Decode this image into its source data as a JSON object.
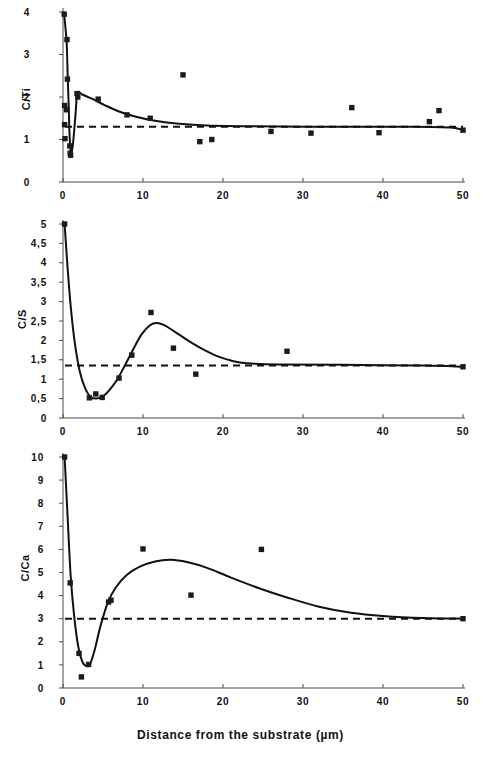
{
  "figure": {
    "xlabel": "Distance from the substrate (µm)",
    "background": "#ffffff",
    "marker_color": "#1b1b1b",
    "curve_color": "#111111",
    "axis_color": "#4a4a4a"
  },
  "chart_data": [
    {
      "type": "scatter",
      "title": "",
      "ylabel": "C/Ti",
      "xlabel": "Distance from the substrate (µm)",
      "xlim": [
        0,
        50
      ],
      "ylim": [
        0,
        4
      ],
      "xticks": [
        0,
        10,
        20,
        30,
        40,
        50
      ],
      "xticklabels": [
        "0",
        "10",
        "20",
        "30",
        "40",
        "50"
      ],
      "yticks": [
        0,
        1,
        2,
        3,
        4
      ],
      "yticklabels": [
        "0",
        "1",
        "2",
        "3",
        "4"
      ],
      "grid": false,
      "legend": null,
      "baseline": 1.3,
      "baseline_style": "dashed",
      "points": [
        {
          "x": 0.15,
          "y": 3.95
        },
        {
          "x": 0.5,
          "y": 3.35
        },
        {
          "x": 0.55,
          "y": 2.42
        },
        {
          "x": 0.2,
          "y": 1.8
        },
        {
          "x": 0.45,
          "y": 1.7
        },
        {
          "x": 0.2,
          "y": 1.35
        },
        {
          "x": 0.25,
          "y": 1.02
        },
        {
          "x": 0.85,
          "y": 0.85
        },
        {
          "x": 0.9,
          "y": 0.68
        },
        {
          "x": 0.95,
          "y": 0.63
        },
        {
          "x": 1.75,
          "y": 2.08
        },
        {
          "x": 1.85,
          "y": 2.0
        },
        {
          "x": 4.4,
          "y": 1.95
        },
        {
          "x": 8.0,
          "y": 1.58
        },
        {
          "x": 10.9,
          "y": 1.5
        },
        {
          "x": 15.0,
          "y": 2.52
        },
        {
          "x": 17.1,
          "y": 0.95
        },
        {
          "x": 18.6,
          "y": 1.0
        },
        {
          "x": 26.0,
          "y": 1.19
        },
        {
          "x": 31.0,
          "y": 1.15
        },
        {
          "x": 36.1,
          "y": 1.75
        },
        {
          "x": 39.5,
          "y": 1.16
        },
        {
          "x": 45.8,
          "y": 1.42
        },
        {
          "x": 47.0,
          "y": 1.68
        },
        {
          "x": 50.0,
          "y": 1.22
        }
      ],
      "fit_curve": [
        {
          "x": 0.12,
          "y": 3.98
        },
        {
          "x": 0.45,
          "y": 3.3
        },
        {
          "x": 0.6,
          "y": 2.4
        },
        {
          "x": 0.72,
          "y": 1.75
        },
        {
          "x": 0.8,
          "y": 1.2
        },
        {
          "x": 0.92,
          "y": 0.8
        },
        {
          "x": 1.05,
          "y": 0.7
        },
        {
          "x": 1.25,
          "y": 0.9
        },
        {
          "x": 1.55,
          "y": 1.55
        },
        {
          "x": 1.8,
          "y": 2.09
        },
        {
          "x": 2.4,
          "y": 2.06
        },
        {
          "x": 3.6,
          "y": 1.96
        },
        {
          "x": 5.2,
          "y": 1.81
        },
        {
          "x": 7.0,
          "y": 1.66
        },
        {
          "x": 9.0,
          "y": 1.54
        },
        {
          "x": 11.5,
          "y": 1.44
        },
        {
          "x": 14.5,
          "y": 1.37
        },
        {
          "x": 18.0,
          "y": 1.33
        },
        {
          "x": 24.0,
          "y": 1.31
        },
        {
          "x": 34.0,
          "y": 1.3
        },
        {
          "x": 44.0,
          "y": 1.3
        },
        {
          "x": 48.5,
          "y": 1.28
        },
        {
          "x": 50.0,
          "y": 1.22
        }
      ]
    },
    {
      "type": "scatter",
      "title": "",
      "ylabel": "C/S",
      "xlabel": "Distance from the substrate (µm)",
      "xlim": [
        0,
        50
      ],
      "ylim": [
        0,
        5
      ],
      "xticks": [
        0,
        10,
        20,
        30,
        40,
        50
      ],
      "xticklabels": [
        "0",
        "10",
        "20",
        "30",
        "40",
        "50"
      ],
      "yticks": [
        0,
        0.5,
        1,
        1.5,
        2,
        2.5,
        3,
        3.5,
        4,
        4.5,
        5
      ],
      "yticklabels": [
        "0",
        "0,5",
        "1",
        "1,5",
        "2",
        "2,5",
        "3",
        "3,5",
        "4",
        "4,5",
        "5"
      ],
      "grid": false,
      "legend": null,
      "baseline": 1.35,
      "baseline_style": "dashed",
      "points": [
        {
          "x": 0.2,
          "y": 5.0
        },
        {
          "x": 3.3,
          "y": 0.52
        },
        {
          "x": 4.1,
          "y": 0.62
        },
        {
          "x": 4.9,
          "y": 0.53
        },
        {
          "x": 7.0,
          "y": 1.03
        },
        {
          "x": 8.6,
          "y": 1.62
        },
        {
          "x": 11.0,
          "y": 2.72
        },
        {
          "x": 13.8,
          "y": 1.8
        },
        {
          "x": 16.6,
          "y": 1.13
        },
        {
          "x": 28.0,
          "y": 1.72
        },
        {
          "x": 50.0,
          "y": 1.32
        }
      ],
      "fit_curve": [
        {
          "x": 0.2,
          "y": 5.0
        },
        {
          "x": 0.6,
          "y": 3.8
        },
        {
          "x": 1.0,
          "y": 2.8
        },
        {
          "x": 1.5,
          "y": 1.9
        },
        {
          "x": 2.1,
          "y": 1.2
        },
        {
          "x": 2.7,
          "y": 0.8
        },
        {
          "x": 3.4,
          "y": 0.55
        },
        {
          "x": 4.2,
          "y": 0.5
        },
        {
          "x": 5.0,
          "y": 0.56
        },
        {
          "x": 5.8,
          "y": 0.72
        },
        {
          "x": 6.8,
          "y": 1.0
        },
        {
          "x": 7.8,
          "y": 1.38
        },
        {
          "x": 8.8,
          "y": 1.78
        },
        {
          "x": 9.8,
          "y": 2.15
        },
        {
          "x": 10.8,
          "y": 2.38
        },
        {
          "x": 11.6,
          "y": 2.45
        },
        {
          "x": 12.6,
          "y": 2.4
        },
        {
          "x": 14.0,
          "y": 2.22
        },
        {
          "x": 15.6,
          "y": 2.0
        },
        {
          "x": 17.4,
          "y": 1.78
        },
        {
          "x": 19.2,
          "y": 1.6
        },
        {
          "x": 21.0,
          "y": 1.48
        },
        {
          "x": 23.0,
          "y": 1.41
        },
        {
          "x": 27.0,
          "y": 1.38
        },
        {
          "x": 35.0,
          "y": 1.37
        },
        {
          "x": 45.0,
          "y": 1.35
        },
        {
          "x": 50.0,
          "y": 1.32
        }
      ]
    },
    {
      "type": "scatter",
      "title": "",
      "ylabel": "C/Ca",
      "xlabel": "Distance from the substrate (µm)",
      "xlim": [
        0,
        50
      ],
      "ylim": [
        0,
        10
      ],
      "xticks": [
        0,
        10,
        20,
        30,
        40,
        50
      ],
      "xticklabels": [
        "0",
        "10",
        "20",
        "30",
        "40",
        "50"
      ],
      "yticks": [
        0,
        1,
        2,
        3,
        4,
        5,
        6,
        7,
        8,
        9,
        10
      ],
      "yticklabels": [
        "0",
        "1",
        "2",
        "3",
        "4",
        "5",
        "6",
        "7",
        "8",
        "9",
        "10"
      ],
      "grid": false,
      "legend": null,
      "baseline": 3.0,
      "baseline_style": "dashed",
      "points": [
        {
          "x": 0.2,
          "y": 10.0
        },
        {
          "x": 0.9,
          "y": 4.55
        },
        {
          "x": 2.0,
          "y": 1.5
        },
        {
          "x": 2.3,
          "y": 0.48
        },
        {
          "x": 3.2,
          "y": 1.02
        },
        {
          "x": 5.7,
          "y": 3.72
        },
        {
          "x": 6.0,
          "y": 3.8
        },
        {
          "x": 10.0,
          "y": 6.02
        },
        {
          "x": 16.0,
          "y": 4.02
        },
        {
          "x": 24.8,
          "y": 6.0
        },
        {
          "x": 50.0,
          "y": 3.0
        }
      ],
      "fit_curve": [
        {
          "x": 0.2,
          "y": 10.0
        },
        {
          "x": 0.55,
          "y": 7.6
        },
        {
          "x": 0.95,
          "y": 4.9
        },
        {
          "x": 1.4,
          "y": 3.1
        },
        {
          "x": 1.9,
          "y": 1.8
        },
        {
          "x": 2.4,
          "y": 1.15
        },
        {
          "x": 2.9,
          "y": 0.95
        },
        {
          "x": 3.4,
          "y": 1.05
        },
        {
          "x": 4.0,
          "y": 1.7
        },
        {
          "x": 4.7,
          "y": 2.7
        },
        {
          "x": 5.6,
          "y": 3.7
        },
        {
          "x": 6.6,
          "y": 4.35
        },
        {
          "x": 8.0,
          "y": 4.9
        },
        {
          "x": 9.6,
          "y": 5.25
        },
        {
          "x": 11.5,
          "y": 5.48
        },
        {
          "x": 13.5,
          "y": 5.55
        },
        {
          "x": 15.5,
          "y": 5.45
        },
        {
          "x": 18.0,
          "y": 5.2
        },
        {
          "x": 21.0,
          "y": 4.78
        },
        {
          "x": 24.5,
          "y": 4.32
        },
        {
          "x": 28.0,
          "y": 3.92
        },
        {
          "x": 32.0,
          "y": 3.52
        },
        {
          "x": 36.0,
          "y": 3.26
        },
        {
          "x": 40.0,
          "y": 3.12
        },
        {
          "x": 45.0,
          "y": 3.03
        },
        {
          "x": 50.0,
          "y": 3.0
        }
      ]
    }
  ]
}
